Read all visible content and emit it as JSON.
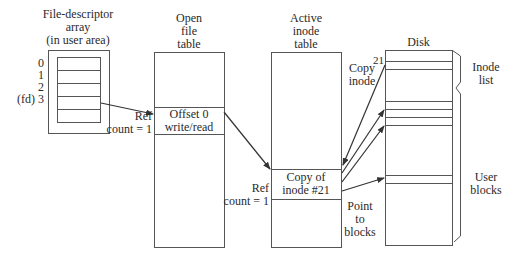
{
  "diagram": {
    "type": "unix-file-system-structures",
    "colors": {
      "line": "#555555",
      "text": "#2a2a2a",
      "background": "#ffffff"
    },
    "columns": [
      {
        "id": "fd-array",
        "title_lines": [
          "File-descriptor",
          "array",
          "(in user area)"
        ],
        "slot_labels": [
          "0",
          "1",
          "2",
          "(fd) 3"
        ]
      },
      {
        "id": "open-file-table",
        "title_lines": [
          "Open",
          "file",
          "table"
        ],
        "entry_lines": [
          "Offset 0",
          "write/read"
        ],
        "ref_lines": [
          "Ref",
          "count = 1"
        ]
      },
      {
        "id": "active-inode-table",
        "title_lines": [
          "Active",
          "inode",
          "table"
        ],
        "entry_lines": [
          "Copy of",
          "inode #21"
        ],
        "ref_lines": [
          "Ref",
          "count = 1"
        ]
      },
      {
        "id": "disk",
        "title": "Disk",
        "inode_number": "21",
        "regions": [
          {
            "label_lines": [
              "Inode",
              "list"
            ]
          },
          {
            "label_lines": [
              "User",
              "blocks"
            ]
          }
        ]
      }
    ],
    "edge_labels": {
      "copy_inode": [
        "Copy",
        "inode"
      ],
      "point_to_blocks": [
        "Point",
        "to",
        "blocks"
      ]
    }
  }
}
